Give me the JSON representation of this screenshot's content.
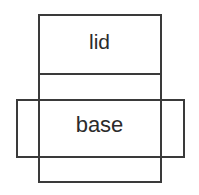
{
  "diagram": {
    "canvas": {
      "width": 199,
      "height": 195,
      "background_color": "#ffffff"
    },
    "stroke": {
      "color": "#3a3a3a",
      "width": 2
    },
    "text_color": "#2b2b2b",
    "shapes": [
      {
        "name": "vertical-panel-rectangle",
        "role": "tall rectangle spanning lid and base panels",
        "x": 38,
        "y": 14,
        "width": 123,
        "height": 168
      },
      {
        "name": "horizontal-flap-rectangle",
        "role": "wide rectangle crossing the base panel",
        "x": 16,
        "y": 99,
        "width": 168,
        "height": 58
      }
    ],
    "lines": [
      {
        "name": "lid-base-divider",
        "x1": 38,
        "y1": 74,
        "x2": 161,
        "y2": 74
      }
    ],
    "labels": {
      "lid": "lid",
      "base": "base"
    }
  }
}
